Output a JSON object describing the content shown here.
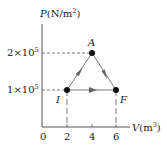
{
  "diagram": {
    "type": "PV-diagram",
    "y_axis_label": "P(N/m²)",
    "y_axis_symbol": "P",
    "y_axis_unit": "(N/m",
    "y_axis_unit_sup": "2",
    "y_axis_unit_close": ")",
    "x_axis_symbol": "V",
    "x_axis_unit": "(m",
    "x_axis_unit_sup": "3",
    "x_axis_unit_close": ")",
    "y_ticks": [
      {
        "mantissa": "2",
        "times": "×",
        "base": "10",
        "exp": "5",
        "value": 200000
      },
      {
        "mantissa": "1",
        "times": "×",
        "base": "10",
        "exp": "5",
        "value": 100000
      }
    ],
    "x_ticks": [
      "0",
      "2",
      "4",
      "6"
    ],
    "points": [
      {
        "label": "I",
        "V": 2,
        "P": 100000
      },
      {
        "label": "A",
        "V": 4,
        "P": 200000
      },
      {
        "label": "F",
        "V": 6,
        "P": 100000
      }
    ],
    "paths": [
      {
        "from": "I",
        "to": "A"
      },
      {
        "from": "A",
        "to": "F"
      },
      {
        "from": "I",
        "to": "F"
      }
    ],
    "colors": {
      "axis": "#555555",
      "line": "#777777",
      "arrow": "#666666",
      "point": "#111111",
      "text": "#222222"
    }
  }
}
